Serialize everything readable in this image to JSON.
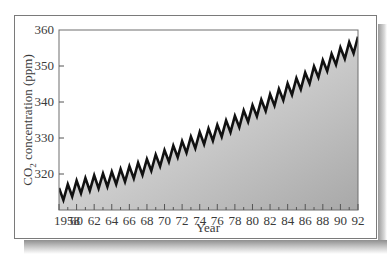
{
  "chart_data": {
    "type": "line",
    "title": "",
    "xlabel": "Year",
    "ylabel": "CO2 concentration (ppm)",
    "ylabel_parts": {
      "main": "CO",
      "sub": "2",
      "rest": " concentration (ppm)"
    },
    "xlim": [
      1958,
      1992
    ],
    "ylim": [
      310,
      360
    ],
    "grid": false,
    "legend": null,
    "fill_under_line": true,
    "y_ticks": [
      320,
      330,
      340,
      350,
      360
    ],
    "x_tick_labels": [
      "1958",
      "60",
      "62",
      "64",
      "66",
      "68",
      "70",
      "72",
      "74",
      "76",
      "78",
      "80",
      "82",
      "84",
      "86",
      "88",
      "90",
      "92"
    ],
    "x_tick_years": [
      1958,
      1960,
      1962,
      1964,
      1966,
      1968,
      1970,
      1972,
      1974,
      1976,
      1978,
      1980,
      1982,
      1984,
      1986,
      1988,
      1990,
      1992
    ],
    "series": [
      {
        "name": "CO2 concentration (approximate; reconstructed as a smooth trend plus seasonal sawtooth, not read point-by-point)",
        "annual_trend_approx": {
          "x": [
            1958,
            1960,
            1962,
            1964,
            1966,
            1968,
            1970,
            1972,
            1974,
            1976,
            1978,
            1980,
            1982,
            1984,
            1986,
            1988,
            1990,
            1992
          ],
          "y": [
            314.5,
            316.5,
            318.0,
            319.0,
            320.5,
            322.5,
            325.0,
            327.5,
            330.0,
            332.0,
            334.5,
            337.5,
            340.5,
            343.5,
            346.5,
            350.0,
            353.5,
            356.5
          ]
        },
        "seasonal_amplitude_approx": 3
      }
    ],
    "colors": {
      "line": "#111111",
      "fill_top": "#f2f2f2",
      "fill_bottom": "#a8a8a8",
      "frame": "#7a7a7a"
    }
  }
}
